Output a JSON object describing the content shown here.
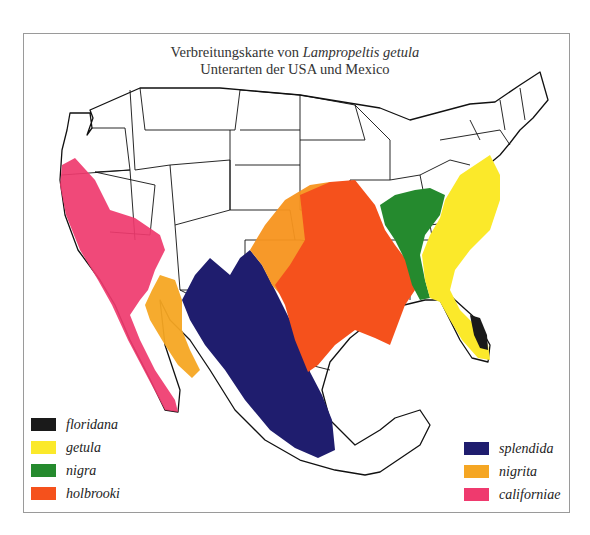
{
  "title": {
    "line1_prefix": "Verbreitungskarte von ",
    "line1_species": "Lampropeltis getula",
    "line2": "Unterarten der USA und Mexico"
  },
  "legend": {
    "left": [
      {
        "label": "floridana",
        "color": "#1a1a1a"
      },
      {
        "label": "getula",
        "color": "#fbe92a"
      },
      {
        "label": "nigra",
        "color": "#258a2e"
      },
      {
        "label": "holbrooki",
        "color": "#f5511c"
      }
    ],
    "right": [
      {
        "label": "splendida",
        "color": "#1f1d6e"
      },
      {
        "label": "nigrita",
        "color": "#f5a623"
      },
      {
        "label": "californiae",
        "color": "#ef3a6e"
      }
    ]
  },
  "regions": {
    "floridana": "#1a1a1a",
    "getula": "#fbe92a",
    "nigra": "#258a2e",
    "holbrooki": "#f5511c",
    "holbrooki_west": "#f7941d",
    "splendida": "#1f1d6e",
    "nigrita": "#f5a623",
    "californiae": "#ef3a6e"
  }
}
